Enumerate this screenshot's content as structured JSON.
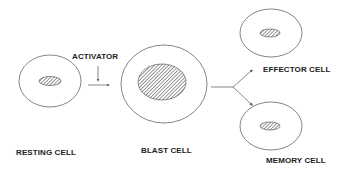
{
  "diagram": {
    "labels": {
      "activator": "ACTIVATOR",
      "resting_cell": "RESTING CELL",
      "blast_cell": "BLAST CELL",
      "effector_cell": "EFFECTOR CELL",
      "memory_cell": "MEMORY CELL"
    },
    "colors": {
      "stroke": "#555555",
      "text": "#222222",
      "hatch": "#444444"
    }
  }
}
